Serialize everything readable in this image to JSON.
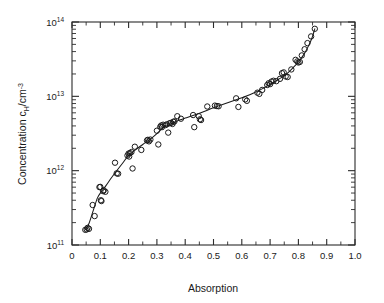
{
  "chart_data": {
    "type": "scatter",
    "title": "",
    "xlabel": "Absorption",
    "ylabel": "Concentration c_H/cm^-3",
    "ylabel_parts": {
      "main": "Concentration c",
      "subscript": "H",
      "mid": "/cm",
      "superscript": "-3"
    },
    "xlim": [
      0,
      1.0
    ],
    "ylim": [
      100000000000.0,
      100000000000000.0
    ],
    "yscale": "log",
    "xscale": "linear",
    "grid": false,
    "legend": null,
    "xticks": [
      0,
      0.1,
      0.2,
      0.3,
      0.4,
      0.5,
      0.6,
      0.7,
      0.8,
      0.9,
      1.0
    ],
    "xtick_labels": [
      "0",
      "0.1",
      "0.2",
      "0.3",
      "0.4",
      "0.5",
      "0.6",
      "0.7",
      "0.8",
      "0.9",
      "1.0"
    ],
    "yticks": [
      100000000000.0,
      1000000000000.0,
      10000000000000.0,
      100000000000000.0
    ],
    "ytick_labels": [
      "10^11",
      "10^12",
      "10^13",
      "10^14"
    ],
    "ytick_mantissa": "10",
    "ytick_exponents": [
      "11",
      "12",
      "13",
      "14"
    ],
    "minor_ticks": true,
    "marker_style": "open-circle",
    "marker_radius_px": 2.7,
    "series": [
      {
        "name": "measured data",
        "marker": "o",
        "points": [
          [
            0.047,
            160000000000.0
          ],
          [
            0.052,
            162000000000.0
          ],
          [
            0.055,
            170000000000.0
          ],
          [
            0.06,
            165000000000.0
          ],
          [
            0.073,
            345000000000.0
          ],
          [
            0.08,
            245000000000.0
          ],
          [
            0.097,
            600000000000.0
          ],
          [
            0.1,
            605000000000.0
          ],
          [
            0.102,
            400000000000.0
          ],
          [
            0.104,
            390000000000.0
          ],
          [
            0.11,
            530000000000.0
          ],
          [
            0.112,
            545000000000.0
          ],
          [
            0.118,
            520000000000.0
          ],
          [
            0.152,
            1280000000000.0
          ],
          [
            0.158,
            920000000000.0
          ],
          [
            0.163,
            910000000000.0
          ],
          [
            0.196,
            1600000000000.0
          ],
          [
            0.2,
            1700000000000.0
          ],
          [
            0.202,
            1550000000000.0
          ],
          [
            0.205,
            1720000000000.0
          ],
          [
            0.21,
            1780000000000.0
          ],
          [
            0.214,
            1070000000000.0
          ],
          [
            0.222,
            2100000000000.0
          ],
          [
            0.245,
            1900000000000.0
          ],
          [
            0.265,
            2550000000000.0
          ],
          [
            0.268,
            2600000000000.0
          ],
          [
            0.272,
            2480000000000.0
          ],
          [
            0.277,
            2620000000000.0
          ],
          [
            0.3,
            3450000000000.0
          ],
          [
            0.305,
            2250000000000.0
          ],
          [
            0.312,
            3900000000000.0
          ],
          [
            0.315,
            4050000000000.0
          ],
          [
            0.318,
            3850000000000.0
          ],
          [
            0.322,
            4150000000000.0
          ],
          [
            0.33,
            4100000000000.0
          ],
          [
            0.335,
            4200000000000.0
          ],
          [
            0.34,
            3250000000000.0
          ],
          [
            0.345,
            4350000000000.0
          ],
          [
            0.35,
            4400000000000.0
          ],
          [
            0.355,
            4250000000000.0
          ],
          [
            0.358,
            4550000000000.0
          ],
          [
            0.362,
            4600000000000.0
          ],
          [
            0.372,
            5400000000000.0
          ],
          [
            0.385,
            5000000000000.0
          ],
          [
            0.428,
            5600000000000.0
          ],
          [
            0.432,
            3850000000000.0
          ],
          [
            0.448,
            5400000000000.0
          ],
          [
            0.452,
            4900000000000.0
          ],
          [
            0.456,
            4800000000000.0
          ],
          [
            0.478,
            7300000000000.0
          ],
          [
            0.505,
            7500000000000.0
          ],
          [
            0.512,
            7400000000000.0
          ],
          [
            0.518,
            7350000000000.0
          ],
          [
            0.58,
            9400000000000.0
          ],
          [
            0.588,
            7200000000000.0
          ],
          [
            0.612,
            9100000000000.0
          ],
          [
            0.618,
            8700000000000.0
          ],
          [
            0.655,
            11200000000000.0
          ],
          [
            0.662,
            10800000000000.0
          ],
          [
            0.672,
            12200000000000.0
          ],
          [
            0.69,
            14200000000000.0
          ],
          [
            0.695,
            15000000000000.0
          ],
          [
            0.7,
            14600000000000.0
          ],
          [
            0.705,
            15800000000000.0
          ],
          [
            0.712,
            16200000000000.0
          ],
          [
            0.722,
            16000000000000.0
          ],
          [
            0.735,
            17200000000000.0
          ],
          [
            0.742,
            20500000000000.0
          ],
          [
            0.748,
            21000000000000.0
          ],
          [
            0.755,
            18500000000000.0
          ],
          [
            0.762,
            18200000000000.0
          ],
          [
            0.775,
            23000000000000.0
          ],
          [
            0.79,
            31000000000000.0
          ],
          [
            0.796,
            29500000000000.0
          ],
          [
            0.8,
            28500000000000.0
          ],
          [
            0.805,
            29000000000000.0
          ],
          [
            0.812,
            35500000000000.0
          ],
          [
            0.822,
            43000000000000.0
          ],
          [
            0.832,
            52000000000000.0
          ],
          [
            0.845,
            64000000000000.0
          ],
          [
            0.858,
            81000000000000.0
          ]
        ]
      },
      {
        "name": "fit curve",
        "marker": "line",
        "points": [
          [
            0.047,
            162000000000.0
          ],
          [
            0.06,
            195000000000.0
          ],
          [
            0.075,
            290000000000.0
          ],
          [
            0.09,
            430000000000.0
          ],
          [
            0.105,
            530000000000.0
          ],
          [
            0.12,
            630000000000.0
          ],
          [
            0.14,
            810000000000.0
          ],
          [
            0.16,
            1020000000000.0
          ],
          [
            0.18,
            1280000000000.0
          ],
          [
            0.2,
            1600000000000.0
          ],
          [
            0.225,
            1920000000000.0
          ],
          [
            0.25,
            2250000000000.0
          ],
          [
            0.275,
            2620000000000.0
          ],
          [
            0.3,
            3150000000000.0
          ],
          [
            0.32,
            3700000000000.0
          ],
          [
            0.34,
            4100000000000.0
          ],
          [
            0.36,
            4450000000000.0
          ],
          [
            0.38,
            4800000000000.0
          ],
          [
            0.4,
            5100000000000.0
          ],
          [
            0.43,
            5550000000000.0
          ],
          [
            0.46,
            6100000000000.0
          ],
          [
            0.49,
            6800000000000.0
          ],
          [
            0.52,
            7500000000000.0
          ],
          [
            0.55,
            8200000000000.0
          ],
          [
            0.58,
            9000000000000.0
          ],
          [
            0.61,
            9900000000000.0
          ],
          [
            0.64,
            11000000000000.0
          ],
          [
            0.67,
            12500000000000.0
          ],
          [
            0.7,
            14500000000000.0
          ],
          [
            0.73,
            17000000000000.0
          ],
          [
            0.755,
            19500000000000.0
          ],
          [
            0.78,
            24000000000000.0
          ],
          [
            0.8,
            29000000000000.0
          ],
          [
            0.82,
            37000000000000.0
          ],
          [
            0.835,
            47000000000000.0
          ],
          [
            0.848,
            61000000000000.0
          ],
          [
            0.858,
            81000000000000.0
          ]
        ]
      }
    ]
  },
  "axes": {
    "x_title": "Absorption",
    "y_title_main": "Concentration c",
    "y_title_sub": "H",
    "y_title_mid": "/cm",
    "y_title_sup": "-3"
  }
}
